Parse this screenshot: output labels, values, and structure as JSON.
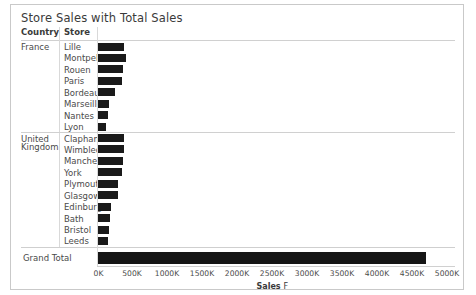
{
  "title": "Store Sales with Total Sales",
  "table": {
    "headers": {
      "country": "Country",
      "store": "Store"
    },
    "grand_total_label": "Grand Total"
  },
  "axis": {
    "title": "Sales",
    "sort_icon": "sort-descending-icon",
    "sort_glyph": "F",
    "ticks": [
      "0K",
      "500K",
      "1000K",
      "1500K",
      "2000K",
      "2500K",
      "3000K",
      "3500K",
      "4000K",
      "4500K",
      "5000K"
    ]
  },
  "colors": {
    "bar": "#1a1a1a",
    "grid": "#d0d0d0",
    "border": "#c9c9c9",
    "text": "#4a4a4a"
  },
  "chart_data": {
    "type": "bar",
    "title": "Store Sales with Total Sales",
    "xlabel": "Sales",
    "ylabel": "",
    "xlim": [
      0,
      5000
    ],
    "xunit": "K",
    "orientation": "horizontal",
    "grid": false,
    "legend": "none",
    "categories": [
      "Lille",
      "Montpellier",
      "Rouen",
      "Paris",
      "Bordeaux",
      "Marseille",
      "Nantes",
      "Lyon",
      "Clapham",
      "Wimbledon",
      "Manchester",
      "York",
      "Plymouth",
      "Glasgow",
      "Edinburgh",
      "Bath",
      "Bristol",
      "Leeds"
    ],
    "values": [
      390,
      415,
      375,
      360,
      255,
      175,
      160,
      130,
      390,
      385,
      370,
      355,
      305,
      295,
      205,
      185,
      165,
      150
    ],
    "groups": [
      {
        "country": "France",
        "stores": [
          {
            "store": "Lille",
            "sales": 390
          },
          {
            "store": "Montpellier",
            "sales": 415
          },
          {
            "store": "Rouen",
            "sales": 375
          },
          {
            "store": "Paris",
            "sales": 360
          },
          {
            "store": "Bordeaux",
            "sales": 255
          },
          {
            "store": "Marseille",
            "sales": 175
          },
          {
            "store": "Nantes",
            "sales": 160
          },
          {
            "store": "Lyon",
            "sales": 130
          }
        ]
      },
      {
        "country": "United Kingdom",
        "country_line1": "United",
        "country_line2": "Kingdom",
        "stores": [
          {
            "store": "Clapham",
            "sales": 390
          },
          {
            "store": "Wimbledon",
            "sales": 385
          },
          {
            "store": "Manchester",
            "sales": 370
          },
          {
            "store": "York",
            "sales": 355
          },
          {
            "store": "Plymouth",
            "sales": 305
          },
          {
            "store": "Glasgow",
            "sales": 295
          },
          {
            "store": "Edinburgh",
            "sales": 205
          },
          {
            "store": "Bath",
            "sales": 185
          },
          {
            "store": "Bristol",
            "sales": 165
          },
          {
            "store": "Leeds",
            "sales": 150
          }
        ]
      }
    ],
    "grand_total": {
      "label": "Grand Total",
      "sales": 4700
    }
  }
}
